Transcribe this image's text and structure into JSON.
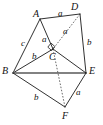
{
  "figure": {
    "background_color": "#ffffff",
    "stroke_color": "#1a1a1a",
    "accent_color": "#5a5a5a",
    "vertices": [
      {
        "name": "A",
        "label": "A",
        "x": 40,
        "y": 19,
        "label_x": 33,
        "label_y": 9
      },
      {
        "name": "B",
        "label": "B",
        "x": 13,
        "y": 73,
        "label_x": 2,
        "label_y": 66
      },
      {
        "name": "C",
        "label": "C",
        "x": 53,
        "y": 49,
        "label_x": 49,
        "label_y": 52
      },
      {
        "name": "D",
        "label": "D",
        "x": 80,
        "y": 14,
        "label_x": 71,
        "label_y": 2
      },
      {
        "name": "E",
        "label": "E",
        "x": 86,
        "y": 73,
        "label_x": 89,
        "label_y": 66
      },
      {
        "name": "F",
        "label": "F",
        "x": 65,
        "y": 107,
        "label_x": 62,
        "label_y": 111
      }
    ],
    "edges": [
      {
        "name": "edge-A-D",
        "from": "A",
        "to": "D",
        "style": "solid"
      },
      {
        "name": "edge-A-B",
        "from": "A",
        "to": "B",
        "style": "solid"
      },
      {
        "name": "edge-A-C",
        "from": "A",
        "to": "C",
        "style": "solid"
      },
      {
        "name": "edge-B-C",
        "from": "B",
        "to": "C",
        "style": "solid"
      },
      {
        "name": "edge-B-E",
        "from": "B",
        "to": "E",
        "style": "thick"
      },
      {
        "name": "edge-B-F",
        "from": "B",
        "to": "F",
        "style": "solid"
      },
      {
        "name": "edge-C-E",
        "from": "C",
        "to": "E",
        "style": "solid"
      },
      {
        "name": "edge-D-E",
        "from": "D",
        "to": "E",
        "style": "solid"
      },
      {
        "name": "edge-E-F",
        "from": "E",
        "to": "F",
        "style": "solid"
      },
      {
        "name": "edge-D-C",
        "from": "D",
        "to": "C",
        "style": "dashed"
      },
      {
        "name": "edge-C-F",
        "from": "C",
        "to": "F",
        "style": "dashed"
      }
    ],
    "right_angle": {
      "name": "right-angle-at-C",
      "at_vertex": "C",
      "x": 51,
      "y": 44,
      "size": 4.5
    },
    "side_labels": [
      {
        "name": "side-label-AD",
        "text": "a",
        "x": 58,
        "y": 9,
        "edge": "A-D"
      },
      {
        "name": "side-label-DC",
        "text": "a",
        "x": 63,
        "y": 27,
        "edge": "D-C"
      },
      {
        "name": "side-label-AC",
        "text": "a",
        "x": 42,
        "y": 35,
        "edge": "A-C"
      },
      {
        "name": "side-label-AB",
        "text": "c",
        "x": 21,
        "y": 39,
        "edge": "A-B"
      },
      {
        "name": "side-label-BC",
        "text": "b",
        "x": 32,
        "y": 52,
        "edge": "B-C"
      },
      {
        "name": "side-label-DE",
        "text": "b",
        "x": 87,
        "y": 38,
        "edge": "D-E"
      },
      {
        "name": "side-label-BF",
        "text": "b",
        "x": 34,
        "y": 93,
        "edge": "B-F"
      },
      {
        "name": "side-label-EF",
        "text": "a",
        "x": 76,
        "y": 88,
        "edge": "E-F"
      }
    ]
  }
}
